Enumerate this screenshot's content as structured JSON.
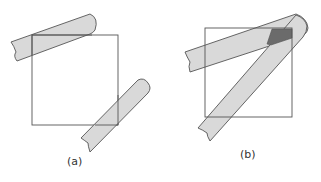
{
  "figures": [
    {
      "id": "a",
      "caption": "(a)",
      "description": "Square with two shaded strips crossing opposite corners without overlapping each other"
    },
    {
      "id": "b",
      "caption": "(b)",
      "description": "Square with two shaded strips joined at a rounded top-right end, overlapping in a dark triangular region inside the square"
    }
  ],
  "colors": {
    "stroke": "#555555",
    "strip_fill": "#d9d9d9",
    "overlap_fill": "#6b6b6b",
    "background": "#ffffff"
  }
}
